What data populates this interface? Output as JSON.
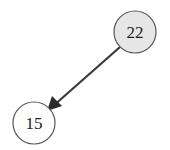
{
  "diagram": {
    "type": "tree",
    "nodes": [
      {
        "id": "n22",
        "label": "22",
        "cx": 135,
        "cy": 32,
        "r": 21,
        "fill": "#e6e6e6",
        "stroke": "#555555"
      },
      {
        "id": "n15",
        "label": "15",
        "cx": 34,
        "cy": 123,
        "r": 21,
        "fill": "#ffffff",
        "stroke": "#555555"
      }
    ],
    "edges": [
      {
        "from": "n22",
        "to": "n15",
        "color": "#3a3a3a",
        "arrow": "end"
      }
    ]
  }
}
